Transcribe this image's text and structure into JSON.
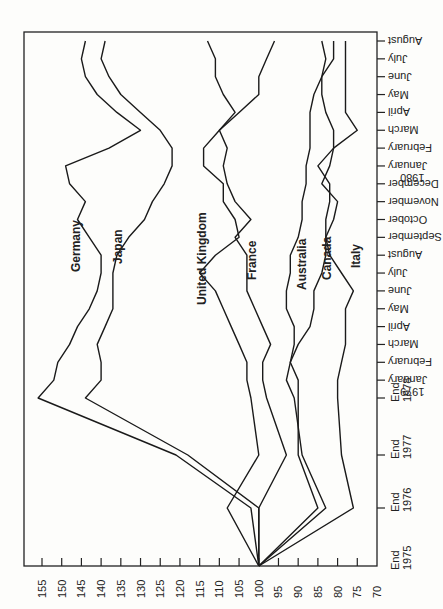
{
  "chart_data": {
    "type": "line",
    "orientation": "rotated-90-clockwise",
    "title": "",
    "xlabel": "",
    "ylabel": "",
    "ylim": [
      70,
      155
    ],
    "y_ticks": [
      155,
      150,
      145,
      140,
      135,
      130,
      125,
      120,
      115,
      110,
      105,
      100,
      95,
      90,
      85,
      80,
      75,
      70
    ],
    "categories": [
      "End 1975",
      "End 1976",
      "End 1977",
      "End 1978",
      "January 1979",
      "February",
      "March",
      "April",
      "May",
      "June",
      "July",
      "August",
      "September",
      "October",
      "November",
      "December",
      "January 1980",
      "February",
      "March",
      "April",
      "May",
      "June",
      "July",
      "August"
    ],
    "x_tick_labels": [
      {
        "line1": "End",
        "line2": "1975"
      },
      {
        "line1": "End",
        "line2": "1976"
      },
      {
        "line1": "End",
        "line2": "1977"
      },
      {
        "line1": "End",
        "line2": "1978"
      },
      {
        "line1": "January",
        "line2": "1979"
      },
      {
        "line1": "February",
        "line2": ""
      },
      {
        "line1": "March",
        "line2": ""
      },
      {
        "line1": "April",
        "line2": ""
      },
      {
        "line1": "May",
        "line2": ""
      },
      {
        "line1": "June",
        "line2": ""
      },
      {
        "line1": "July",
        "line2": ""
      },
      {
        "line1": "August",
        "line2": ""
      },
      {
        "line1": "September",
        "line2": ""
      },
      {
        "line1": "October",
        "line2": ""
      },
      {
        "line1": "November",
        "line2": ""
      },
      {
        "line1": "December",
        "line2": ""
      },
      {
        "line1": "January",
        "line2": "1980"
      },
      {
        "line1": "February",
        "line2": ""
      },
      {
        "line1": "March",
        "line2": ""
      },
      {
        "line1": "April",
        "line2": ""
      },
      {
        "line1": "May",
        "line2": ""
      },
      {
        "line1": "June",
        "line2": ""
      },
      {
        "line1": "July",
        "line2": ""
      },
      {
        "line1": "August",
        "line2": ""
      }
    ],
    "series": [
      {
        "name": "Germany",
        "values": [
          100,
          102,
          121,
          156,
          152,
          151,
          148,
          146,
          143,
          141,
          140,
          140,
          143,
          146,
          144,
          148,
          149,
          138,
          130,
          136,
          141,
          144,
          145,
          144
        ]
      },
      {
        "name": "Japan",
        "values": [
          100,
          100,
          118,
          144,
          140,
          140,
          141,
          139,
          137,
          137,
          137,
          136,
          133,
          129,
          127,
          124,
          122,
          122,
          125,
          130,
          135,
          138,
          140,
          139
        ]
      },
      {
        "name": "United Kingdom",
        "values": [
          100,
          108,
          100,
          102,
          103,
          103,
          105,
          107,
          109,
          111,
          115,
          111,
          105,
          106,
          109,
          109,
          114,
          114,
          110,
          106,
          109,
          111,
          111,
          113
        ]
      },
      {
        "name": "France",
        "values": [
          100,
          100,
          93,
          98,
          99,
          99,
          97,
          99,
          101,
          103,
          103,
          103,
          106,
          102,
          106,
          108,
          109,
          108,
          110,
          105,
          100,
          100,
          98,
          96
        ]
      },
      {
        "name": "Australia",
        "values": [
          100,
          85,
          90,
          90,
          90,
          92,
          91,
          91,
          93,
          93,
          92,
          92,
          90,
          89,
          89,
          88,
          88,
          87,
          87,
          87,
          86,
          84,
          81,
          81
        ]
      },
      {
        "name": "Canada",
        "values": [
          100,
          83,
          89,
          91,
          93,
          92,
          90,
          87,
          86,
          86,
          84,
          83,
          83,
          81,
          80,
          84,
          82,
          81,
          81,
          83,
          84,
          84,
          83,
          84
        ]
      },
      {
        "name": "Italy",
        "values": [
          100,
          76,
          79,
          80,
          80,
          79,
          78,
          78,
          78,
          76,
          79,
          82,
          83,
          83,
          82,
          82,
          85,
          81,
          75,
          78,
          78,
          78,
          78,
          78
        ]
      }
    ],
    "grid": false,
    "legend": "inline labels"
  },
  "labels": {
    "germany": "Germany",
    "japan": "Japan",
    "uk": "United Kingdom",
    "france": "France",
    "australia": "Australia",
    "canada": "Canada",
    "italy": "Italy"
  }
}
